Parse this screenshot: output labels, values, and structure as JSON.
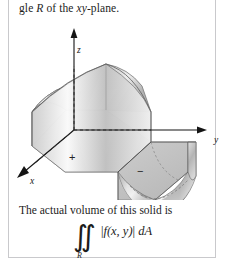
{
  "page": {
    "background": "#ffffff",
    "frame_color": "#c9c9cc",
    "width": 225,
    "height": 275
  },
  "top_text": {
    "before": "gle ",
    "region_symbol": "R",
    "after": " of the ",
    "plane_symbol": "xy",
    "tail": "-plane."
  },
  "figure": {
    "name": "saddle-surface-over-region",
    "axes": {
      "z_label": "z",
      "y_label": "y",
      "x_label": "x"
    },
    "annotations": {
      "positive_sign": "+",
      "negative_sign": "−"
    },
    "colors": {
      "surface_light": "#f2f2f2",
      "surface_mid": "#bdbdbd",
      "surface_dark": "#8a8a8a",
      "outline": "#4a4a4a",
      "axis": "#1a1a1a",
      "dashed": "#3a3a3a"
    }
  },
  "caption": {
    "text": "The actual volume of this solid is"
  },
  "formula": {
    "integral_symbol": "∬",
    "subscript": "R",
    "integrand": "| f(x, y)| dA",
    "integrand_parts": {
      "abs_open": "|",
      "f": "f",
      "args": "(x, y)",
      "abs_close": "|",
      "measure": "dA"
    }
  }
}
